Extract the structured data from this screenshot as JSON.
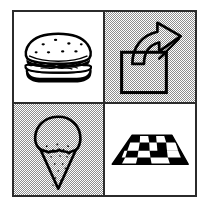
{
  "figure": {
    "layout": "2x2 grid",
    "border_color": "#2b2b2b",
    "ink_color": "#000000",
    "paper_color": "#ffffff",
    "halftone_color": "#8e8e8e"
  },
  "panels": [
    {
      "position": "top-left",
      "icon": "sandwich-icon",
      "label": "Sandwich",
      "background": "white",
      "style": "black line art with seed dots on bun, lettuce and filling layers"
    },
    {
      "position": "top-right",
      "icon": "curved-arrow-out-of-box-icon",
      "label": "Arrow out of box",
      "background": "halftone-gray",
      "style": "outlined square with hollow curved arrow rising up and to the right"
    },
    {
      "position": "bottom-left",
      "icon": "ice-cream-cone-icon",
      "label": "Ice cream cone",
      "background": "halftone-gray",
      "style": "round scoop with wavy drip edge above a stippled triangular cone"
    },
    {
      "position": "bottom-right",
      "icon": "checkerboard-perspective-icon",
      "label": "Checkerboard",
      "background": "white",
      "style": "black and white checkered plane drawn in perspective as a trapezoid"
    }
  ]
}
